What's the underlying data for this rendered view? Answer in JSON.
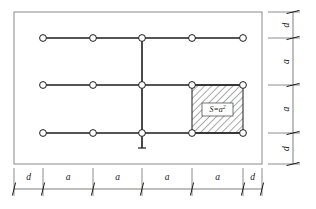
{
  "diagram": {
    "outer_boundary": {
      "name": "slab-outline",
      "x": 14,
      "y": 12,
      "width": 248,
      "height": 152,
      "stroke": "#8a8a86"
    },
    "grid": {
      "columns_x": [
        43,
        93,
        142,
        192,
        243
      ],
      "rows_y": [
        38,
        85,
        133
      ],
      "node_radius": 3.4,
      "node_stroke": "#1c1c1c",
      "node_fill": "#ffffff",
      "line_stroke": "#1c1c1c",
      "node_count": 15
    },
    "center_axis": {
      "name": "vertical-centre-axis",
      "x": 142,
      "y_top": 38,
      "y_bottom": 148,
      "tick_half_width": 4
    },
    "hatched_area": {
      "name": "tributary-area",
      "x": 192,
      "y": 85,
      "width": 51,
      "height": 48,
      "hatch_angle_deg": 45,
      "hatch_spacing": 5,
      "hatch_stroke": "#2a2a2a",
      "border_stroke": "#1c1c1c",
      "label": "S=a",
      "label_exponent": "2",
      "label_box": {
        "x": 202,
        "y": 103,
        "width": 31,
        "height": 13
      }
    },
    "bottom_dimension": {
      "name": "bottom-dimension-chain",
      "line_y": 189,
      "start_x": 14,
      "end_x": 262,
      "label_y": 180,
      "tick_length": 13,
      "ticks_x": [
        14,
        43,
        93,
        142,
        192,
        243,
        262
      ],
      "segments": [
        {
          "label": "d",
          "from": 14,
          "to": 43
        },
        {
          "label": "a",
          "from": 43,
          "to": 93
        },
        {
          "label": "a",
          "from": 93,
          "to": 142
        },
        {
          "label": "a",
          "from": 142,
          "to": 192
        },
        {
          "label": "a",
          "from": 192,
          "to": 243
        },
        {
          "label": "d",
          "from": 243,
          "to": 262
        }
      ]
    },
    "right_dimension": {
      "name": "right-dimension-chain",
      "line_x": 293,
      "start_y": 12,
      "end_y": 164,
      "label_x": 284,
      "tick_length": 13,
      "ticks_y": [
        12,
        38,
        85,
        133,
        164
      ],
      "segments": [
        {
          "label": "d",
          "from": 12,
          "to": 38
        },
        {
          "label": "a",
          "from": 38,
          "to": 85
        },
        {
          "label": "a",
          "from": 85,
          "to": 133
        },
        {
          "label": "d",
          "from": 133,
          "to": 164
        }
      ]
    },
    "extension_lines": {
      "name": "extension-lines",
      "stroke": "#6f6f6c",
      "bottom_from_y": 168,
      "bottom_to_y": 196,
      "right_from_x": 268,
      "right_to_x": 300
    },
    "colors": {
      "ink": "#1c1c1c",
      "light_ink": "#6f6f6c",
      "outline": "#8a8a86",
      "background": "#ffffff"
    }
  }
}
